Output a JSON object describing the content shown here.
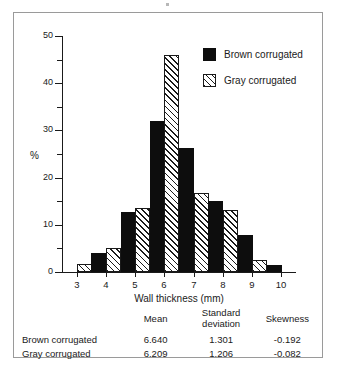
{
  "chart_data": {
    "type": "bar",
    "title": "",
    "xlabel": "Wall thickness (mm)",
    "ylabel": "%",
    "categories": [
      3,
      4,
      5,
      6,
      7,
      8,
      9,
      10
    ],
    "xlim": [
      2.5,
      10.5
    ],
    "ylim": [
      0,
      50
    ],
    "yticks": [
      0,
      10,
      20,
      30,
      40,
      50
    ],
    "yticks_minor": [
      5,
      15,
      25,
      35,
      45
    ],
    "grid": false,
    "legend_position": "top-right",
    "series": [
      {
        "name": "Brown corrugated",
        "fill": "solid-black",
        "values": [
          0,
          4.0,
          12.7,
          32.0,
          26.3,
          15.0,
          7.8,
          1.4
        ]
      },
      {
        "name": "Gray corrugated",
        "fill": "diagonal-hatch",
        "values": [
          1.8,
          5.0,
          13.6,
          46.0,
          16.8,
          13.2,
          2.5,
          0
        ]
      }
    ]
  },
  "axis": {
    "y_labels": [
      "50",
      "40",
      "30",
      "20",
      "10",
      "0"
    ],
    "x_labels": [
      "3",
      "4",
      "5",
      "6",
      "7",
      "8",
      "9",
      "10"
    ],
    "y_title": "%",
    "x_title": "Wall thickness (mm)"
  },
  "legend": {
    "items": [
      {
        "label": "Brown corrugated",
        "swatch": "solid-black"
      },
      {
        "label": "Gray corrugated",
        "swatch": "diagonal-hatch"
      }
    ]
  },
  "stats_table": {
    "headers": [
      "",
      "Mean",
      "Standard deviation",
      "Skewness"
    ],
    "rows": [
      {
        "name": "Brown corrugated",
        "mean": "6.640",
        "sd": "1.301",
        "skewness": "-0.192"
      },
      {
        "name": "Gray corrugated",
        "mean": "6.209",
        "sd": "1.206",
        "skewness": "-0.082"
      }
    ]
  },
  "colors": {
    "brown_series": "#0d0d0d",
    "gray_series": "#ffffff",
    "axis": "#1a1a1a",
    "frame": "#9a9a9a"
  }
}
